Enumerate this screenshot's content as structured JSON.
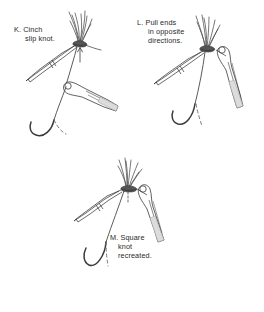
{
  "figure": {
    "background_color": "#ffffff",
    "ink_color": "#3a3a3a",
    "shade_color": "#d8d8d8",
    "text_color": "#2b2b2b"
  },
  "panels": [
    {
      "id": "K",
      "letter": "K.",
      "caption_lines": [
        "K. Cinch",
        "slip knot."
      ],
      "line1": "K. Cinch",
      "line2": "slip knot.",
      "elements": {
        "knot": "slip-knot",
        "instrument_left": "forceps",
        "instrument_right": "needle-holder",
        "needle": "curved-needle",
        "suture_fan": "suture-ends-fanned"
      }
    },
    {
      "id": "L",
      "letter": "L.",
      "caption_lines": [
        "L. Pull ends",
        "in opposite",
        "directions."
      ],
      "line1": "L. Pull ends",
      "line2": "in opposite",
      "line3": "directions.",
      "elements": {
        "knot": "tightening-knot",
        "instrument_left": "forceps",
        "instrument_right": "needle-holder",
        "needle": "curved-needle",
        "suture_fan": "suture-ends-fanned"
      }
    },
    {
      "id": "M",
      "letter": "M.",
      "caption_lines": [
        "M. Square",
        "knot",
        "recreated."
      ],
      "line1": "M. Square",
      "line2": "knot",
      "line3": "recreated.",
      "elements": {
        "knot": "square-knot",
        "instrument_left": "forceps",
        "instrument_right": "needle-holder",
        "needle": "curved-needle",
        "suture_fan": "suture-ends-fanned"
      }
    }
  ]
}
